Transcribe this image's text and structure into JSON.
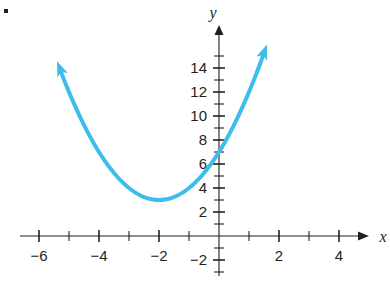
{
  "figure": {
    "bullet_marker": "•",
    "axis_x_name": "x",
    "axis_y_name": "y"
  },
  "chart_data": {
    "type": "line",
    "title": "",
    "subtitle": "",
    "xlabel": "x",
    "ylabel": "y",
    "grid": false,
    "legend": "none",
    "xlim": [
      -6.6,
      5.7
    ],
    "ylim": [
      -2.6,
      15.6
    ],
    "x_major_ticks": [
      -6,
      -4,
      -2,
      2,
      4
    ],
    "x_major_tick_labels": [
      "−6",
      "−4",
      "−2",
      "2",
      "4"
    ],
    "x_minor_ticks": [
      -5,
      -3,
      -1,
      1,
      3,
      5
    ],
    "y_major_ticks": [
      -2,
      2,
      4,
      6,
      8,
      10,
      12,
      14
    ],
    "y_major_tick_labels": [
      "−2",
      "2",
      "4",
      "6",
      "8",
      "10",
      "12",
      "14"
    ],
    "y_minor_ticks": [
      -1,
      1,
      3,
      5,
      7,
      9,
      11,
      13,
      15
    ],
    "series": [
      {
        "name": "parabola",
        "color": "#3dbced",
        "line_width": 4,
        "equation": "y = x^2 + 4x + 7",
        "vertex": [
          -2,
          3
        ],
        "y_intercept": 7,
        "arrow_start": true,
        "arrow_end": true,
        "x": [
          -5.4,
          -5.2,
          -5.0,
          -4.8,
          -4.6,
          -4.4,
          -4.2,
          -4.0,
          -3.8,
          -3.6,
          -3.4,
          -3.2,
          -3.0,
          -2.8,
          -2.6,
          -2.4,
          -2.2,
          -2.0,
          -1.8,
          -1.6,
          -1.4,
          -1.2,
          -1.0,
          -0.8,
          -0.6,
          -0.4,
          -0.2,
          0.0,
          0.2,
          0.4,
          0.6,
          0.8,
          1.0,
          1.2,
          1.4,
          1.6
        ],
        "y": [
          14.56,
          13.24,
          12.0,
          10.84,
          9.76,
          8.76,
          7.84,
          7.0,
          6.24,
          5.56,
          4.96,
          4.44,
          4.0,
          3.64,
          3.36,
          3.16,
          3.04,
          3.0,
          3.04,
          3.16,
          3.36,
          3.64,
          4.0,
          4.44,
          4.96,
          5.56,
          6.24,
          7.0,
          7.84,
          8.76,
          9.76,
          10.84,
          12.0,
          13.24,
          14.56,
          15.96
        ]
      }
    ]
  }
}
